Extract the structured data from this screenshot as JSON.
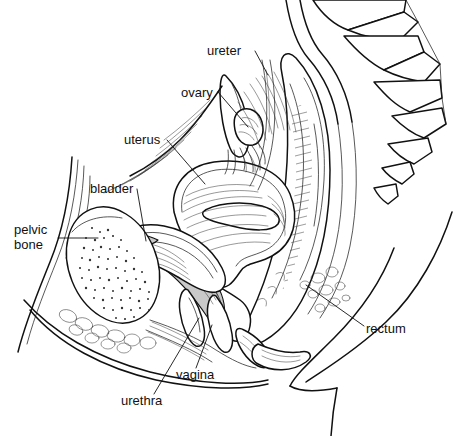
{
  "figure": {
    "kind": "anatomical-illustration",
    "style": "black and white line drawing with hatching and stippling",
    "background_color": "#ffffff",
    "line_color": "#111111",
    "shading_color": "#c9c9c9",
    "width": 455,
    "height": 436
  },
  "labels": [
    {
      "id": "ureter",
      "text": "ureter",
      "text_x": 207,
      "text_y": 55,
      "anchor": "start",
      "leader": "M 255 51 L 268 75"
    },
    {
      "id": "ovary",
      "text": "ovary",
      "text_x": 181,
      "text_y": 97,
      "anchor": "start",
      "leader": "M 218 92 L 248 127"
    },
    {
      "id": "uterus",
      "text": "uterus",
      "text_x": 124,
      "text_y": 144,
      "anchor": "start",
      "leader": "M 167 140 L 205 184"
    },
    {
      "id": "bladder",
      "text": "bladder",
      "text_x": 90,
      "text_y": 193,
      "anchor": "start",
      "leader": "M 137 189 L 146 241"
    },
    {
      "id": "pelvic-bone",
      "text": "pelvic bone",
      "text_lines": [
        "pelvic",
        "bone"
      ],
      "text_x": 14,
      "text_y": 234,
      "line_height": 15,
      "anchor": "start",
      "leader": "M 58 238 L 98 238"
    },
    {
      "id": "vagina",
      "text": "vagina",
      "text_x": 176,
      "text_y": 379,
      "anchor": "start",
      "leader": "M 196 368 L 212 325"
    },
    {
      "id": "urethra",
      "text": "urethra",
      "text_x": 121,
      "text_y": 405,
      "anchor": "start",
      "leader": "M 154 394 L 199 318"
    },
    {
      "id": "rectum",
      "text": "rectum",
      "text_x": 366,
      "text_y": 333,
      "anchor": "start",
      "leader": "M 364 326 L 306 285"
    }
  ],
  "structures": [
    {
      "id": "sacrum-coccyx",
      "name": "sacrum and coccyx vertebrae"
    },
    {
      "id": "uterus-body",
      "name": "uterus"
    },
    {
      "id": "ovary-body",
      "name": "ovary"
    },
    {
      "id": "fallopian-tube",
      "name": "fallopian tube with fimbriae"
    },
    {
      "id": "bladder-body",
      "name": "urinary bladder"
    },
    {
      "id": "pubic-bone",
      "name": "pubic bone"
    },
    {
      "id": "rectum-body",
      "name": "rectum"
    },
    {
      "id": "vagina-canal",
      "name": "vagina"
    },
    {
      "id": "urethra-canal",
      "name": "urethra"
    },
    {
      "id": "abdominal-wall",
      "name": "anterior abdominal wall"
    },
    {
      "id": "buttock-contour",
      "name": "buttock and thigh contour"
    }
  ]
}
